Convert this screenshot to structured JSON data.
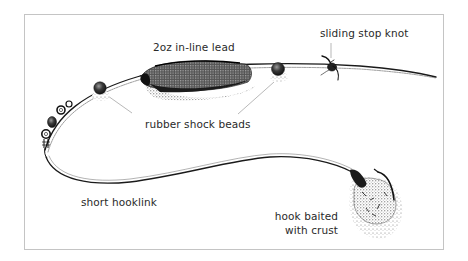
{
  "diagram": {
    "type": "fishing-rig-illustration",
    "colors": {
      "frame": "#c4c4c4",
      "ink": "#1a1a1a",
      "text": "#2a2a2a",
      "leader": "#9a9a9a",
      "stipple": "#555555"
    },
    "labels": {
      "lead": "2oz in-line lead",
      "stop_knot": "sliding stop knot",
      "beads": "rubber shock beads",
      "hooklink": "short hooklink",
      "bait_line1": "hook baited",
      "bait_line2": "with crust"
    },
    "components": [
      {
        "id": "main-line",
        "name": "main line"
      },
      {
        "id": "lead",
        "name": "2oz in-line lead"
      },
      {
        "id": "bead-left",
        "name": "rubber shock bead"
      },
      {
        "id": "bead-right",
        "name": "rubber shock bead"
      },
      {
        "id": "stop-knot",
        "name": "sliding stop knot"
      },
      {
        "id": "swivel",
        "name": "swivel"
      },
      {
        "id": "hooklink",
        "name": "short hooklink"
      },
      {
        "id": "hook-bait",
        "name": "hook baited with crust"
      }
    ]
  }
}
